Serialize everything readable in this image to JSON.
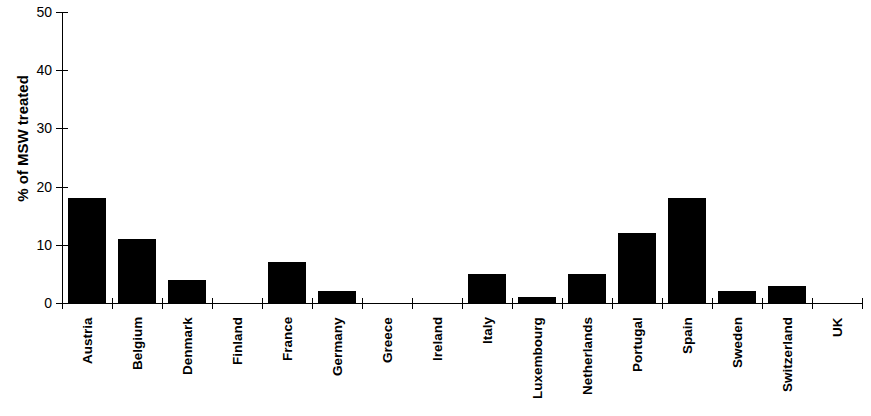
{
  "chart_data": {
    "type": "bar",
    "title": "",
    "subtitle": "",
    "xlabel": "",
    "ylabel": "% of MSW treated",
    "ylim": [
      0,
      50
    ],
    "yticks": [
      0,
      10,
      20,
      30,
      40,
      50
    ],
    "grid": false,
    "legend": null,
    "bar_color": "#000000",
    "categories": [
      "Austria",
      "Belgium",
      "Denmark",
      "Finland",
      "France",
      "Germany",
      "Greece",
      "Ireland",
      "Italy",
      "Luxembourg",
      "Netherlands",
      "Portugal",
      "Spain",
      "Sweden",
      "Switzerland",
      "UK"
    ],
    "values": [
      18,
      11,
      4,
      0,
      7,
      2,
      0,
      0,
      5,
      1,
      5,
      12,
      18,
      2,
      3,
      0
    ]
  }
}
